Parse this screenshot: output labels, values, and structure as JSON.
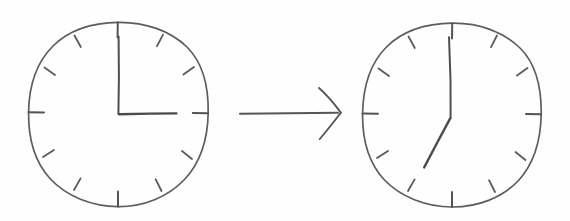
{
  "scene": {
    "title": "Clock time change sketch",
    "description": "Two hand-drawn analog clock faces connected by a rightward arrow",
    "background_color": "#fefefe",
    "ink_color": "#56565a",
    "width": 570,
    "height": 221
  },
  "clocks": [
    {
      "id": "before",
      "label": "Clock before",
      "center_x": 118,
      "center_y": 114,
      "radius_x": 90,
      "radius_y": 92,
      "tick_count": 12,
      "time_reading": "3:00",
      "hour_value": 3,
      "minute_value": 0,
      "minute_hand": {
        "name": "minute-hand",
        "angle_deg": 0,
        "length": 78,
        "points_to_hour": 12
      },
      "hour_hand": {
        "name": "hour-hand",
        "angle_deg": 90,
        "length": 58,
        "points_to_hour": 3
      }
    },
    {
      "id": "after",
      "label": "Clock after",
      "center_x": 452,
      "center_y": 116,
      "radius_x": 89,
      "radius_y": 92,
      "tick_count": 12,
      "time_reading": "7:00",
      "hour_value": 7,
      "minute_value": 0,
      "minute_hand": {
        "name": "minute-hand",
        "angle_deg": 2,
        "length": 80,
        "points_to_hour": 12
      },
      "hour_hand": {
        "name": "hour-hand",
        "angle_deg": 208,
        "length": 56,
        "points_to_hour": 7
      }
    }
  ],
  "arrow": {
    "label": "transition arrow",
    "direction": "right",
    "start_x": 240,
    "start_y": 113,
    "end_x": 341,
    "end_y": 113
  }
}
